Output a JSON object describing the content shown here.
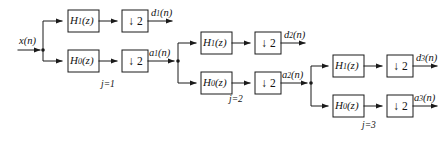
{
  "figure": {
    "type": "block-diagram",
    "input_label": "x(n)",
    "background_color": "#ffffff",
    "line_color": "#1a1a1a"
  },
  "blocks": {
    "highpass_label_main": "H",
    "highpass_label_sub": "1",
    "highpass_label_arg": "(z)",
    "lowpass_label_main": "H",
    "lowpass_label_sub": "0",
    "lowpass_label_arg": "(z)",
    "downsample_arrow": "↓",
    "downsample_factor": "2"
  },
  "stages": [
    {
      "id": "stage-1",
      "stage_label_j": "j",
      "stage_label_eq": "=1",
      "stage_label_text": "j=1",
      "highpass": "H1(z)",
      "lowpass": "H0(z)",
      "downsampler": "↓ 2",
      "detail_output": {
        "main": "d",
        "sub": "1",
        "arg": "(n)",
        "text": "d1(n)"
      },
      "approx_output": {
        "main": "a",
        "sub": "1",
        "arg": "(n)",
        "text": "a1(n)"
      }
    },
    {
      "id": "stage-2",
      "stage_label_j": "j",
      "stage_label_eq": "=2",
      "stage_label_text": "j=2",
      "highpass": "H1(z)",
      "lowpass": "H0(z)",
      "downsampler": "↓ 2",
      "detail_output": {
        "main": "d",
        "sub": "2",
        "arg": "(n)",
        "text": "d2(n)"
      },
      "approx_output": {
        "main": "a",
        "sub": "2",
        "arg": "(n)",
        "text": "a2(n)"
      }
    },
    {
      "id": "stage-3",
      "stage_label_j": "j",
      "stage_label_eq": "=3",
      "stage_label_text": "j=3",
      "highpass": "H1(z)",
      "lowpass": "H0(z)",
      "downsampler": "↓ 2",
      "detail_output": {
        "main": "d",
        "sub": "3",
        "arg": "(n)",
        "text": "d3(n)"
      },
      "approx_output": {
        "main": "a",
        "sub": "3",
        "arg": "(n)",
        "text": "a3(n)"
      }
    }
  ],
  "input": {
    "main": "x",
    "arg": "(n)",
    "text": "x(n)"
  }
}
